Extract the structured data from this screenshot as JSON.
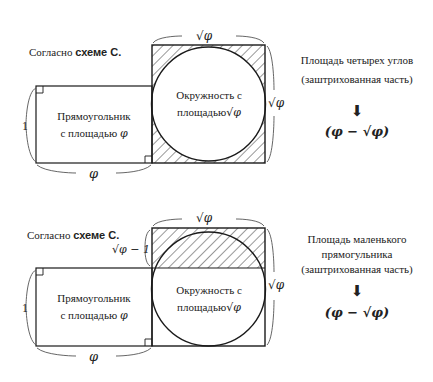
{
  "top": {
    "heading_prefix": "Согласно ",
    "heading_bold": "схеме С.",
    "rect_label_line1": "Прямоугольник",
    "rect_label_line2": "с площадью",
    "rect_symbol": "φ",
    "circle_label_line1": "Окружность с",
    "circle_label_line2": "площадью",
    "circle_symbol": "√φ",
    "dim_height": "1",
    "dim_width": "φ",
    "dim_square_top": "√φ",
    "dim_square_right": "√φ",
    "explain_line1": "Площадь четырех углов",
    "explain_line2": "(заштрихованная часть)",
    "arrow": "⬇",
    "result": "(φ − √φ)"
  },
  "bottom": {
    "heading_prefix": "Согласно ",
    "heading_bold": "схеме С.",
    "rect_label_line1": "Прямоугольник",
    "rect_label_line2": "с площадью",
    "rect_symbol": "φ",
    "circle_label_line1": "Окружность с",
    "circle_label_line2": "площадью",
    "circle_symbol": "√φ",
    "dim_height": "1",
    "dim_width": "φ",
    "dim_band": "√φ − 1",
    "dim_square_top": "√φ",
    "dim_square_right": "√φ",
    "explain_line1": "Площадь маленького",
    "explain_line2": "прямогульника",
    "explain_line3": "(заштрихованная часть)",
    "arrow": "⬇",
    "result": "(φ − √φ)"
  },
  "colors": {
    "stroke": "#1a1a1a",
    "hatch": "#333333",
    "text": "#222222"
  }
}
